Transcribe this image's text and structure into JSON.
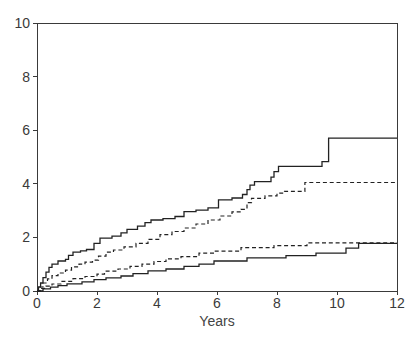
{
  "chart_data": {
    "type": "line",
    "subtype": "step-cumulative-incidence",
    "xlabel": "Years",
    "ylabel": "",
    "xlim": [
      0,
      12
    ],
    "ylim": [
      0,
      10
    ],
    "x_ticks": [
      0,
      2,
      4,
      6,
      8,
      10,
      12
    ],
    "y_ticks": [
      0,
      2,
      4,
      6,
      8,
      10
    ],
    "grid": false,
    "legend": "none",
    "box": true,
    "axis_color": "#3a3a3a",
    "line_color": "#222222",
    "background_color": "#ffffff",
    "series": [
      {
        "name": "upper-solid-curve",
        "style": "solid",
        "step": true,
        "final_value": 5.7,
        "points": [
          [
            0,
            0
          ],
          [
            0.05,
            0.15
          ],
          [
            0.12,
            0.3
          ],
          [
            0.2,
            0.5
          ],
          [
            0.3,
            0.7
          ],
          [
            0.4,
            0.88
          ],
          [
            0.5,
            1.0
          ],
          [
            0.7,
            1.12
          ],
          [
            0.95,
            1.18
          ],
          [
            1.05,
            1.33
          ],
          [
            1.2,
            1.45
          ],
          [
            1.45,
            1.5
          ],
          [
            1.65,
            1.55
          ],
          [
            1.9,
            1.78
          ],
          [
            2.1,
            1.97
          ],
          [
            2.5,
            2.05
          ],
          [
            2.8,
            2.17
          ],
          [
            3.0,
            2.3
          ],
          [
            3.35,
            2.42
          ],
          [
            3.6,
            2.55
          ],
          [
            3.8,
            2.65
          ],
          [
            4.2,
            2.7
          ],
          [
            4.6,
            2.78
          ],
          [
            4.9,
            2.96
          ],
          [
            5.3,
            3.02
          ],
          [
            5.7,
            3.1
          ],
          [
            6.05,
            3.4
          ],
          [
            6.5,
            3.47
          ],
          [
            6.85,
            3.6
          ],
          [
            7.0,
            3.78
          ],
          [
            7.1,
            3.95
          ],
          [
            7.25,
            4.08
          ],
          [
            7.8,
            4.25
          ],
          [
            7.9,
            4.45
          ],
          [
            8.05,
            4.65
          ],
          [
            9.5,
            4.83
          ],
          [
            9.72,
            5.7
          ],
          [
            12,
            5.7
          ]
        ]
      },
      {
        "name": "upper-dashed-curve",
        "style": "dashed",
        "step": true,
        "final_value": 4.05,
        "points": [
          [
            0,
            0
          ],
          [
            0.1,
            0.15
          ],
          [
            0.2,
            0.3
          ],
          [
            0.35,
            0.45
          ],
          [
            0.5,
            0.57
          ],
          [
            0.7,
            0.67
          ],
          [
            0.95,
            0.78
          ],
          [
            1.15,
            0.9
          ],
          [
            1.4,
            1.0
          ],
          [
            1.6,
            1.08
          ],
          [
            1.85,
            1.15
          ],
          [
            2.05,
            1.3
          ],
          [
            2.3,
            1.45
          ],
          [
            2.55,
            1.53
          ],
          [
            2.9,
            1.65
          ],
          [
            3.3,
            1.78
          ],
          [
            3.7,
            1.93
          ],
          [
            4.1,
            2.1
          ],
          [
            4.5,
            2.22
          ],
          [
            4.9,
            2.35
          ],
          [
            5.3,
            2.5
          ],
          [
            5.7,
            2.65
          ],
          [
            6.1,
            2.8
          ],
          [
            6.5,
            2.95
          ],
          [
            6.8,
            3.05
          ],
          [
            7.0,
            3.3
          ],
          [
            7.15,
            3.46
          ],
          [
            7.6,
            3.55
          ],
          [
            8.0,
            3.65
          ],
          [
            8.25,
            3.72
          ],
          [
            8.93,
            4.05
          ],
          [
            12,
            4.05
          ]
        ]
      },
      {
        "name": "lower-dashed-curve",
        "style": "dashed",
        "step": true,
        "final_value": 1.8,
        "points": [
          [
            0,
            0
          ],
          [
            0.12,
            0.1
          ],
          [
            0.3,
            0.18
          ],
          [
            0.5,
            0.26
          ],
          [
            0.8,
            0.36
          ],
          [
            1.2,
            0.46
          ],
          [
            1.6,
            0.54
          ],
          [
            2.0,
            0.63
          ],
          [
            2.25,
            0.74
          ],
          [
            2.7,
            0.82
          ],
          [
            3.1,
            0.92
          ],
          [
            3.5,
            1.0
          ],
          [
            3.9,
            1.1
          ],
          [
            4.3,
            1.2
          ],
          [
            4.8,
            1.28
          ],
          [
            5.4,
            1.41
          ],
          [
            5.9,
            1.49
          ],
          [
            6.8,
            1.62
          ],
          [
            7.9,
            1.69
          ],
          [
            9.0,
            1.8
          ],
          [
            12,
            1.8
          ]
        ]
      },
      {
        "name": "lower-solid-curve",
        "style": "solid",
        "step": true,
        "final_value": 1.78,
        "points": [
          [
            0,
            0
          ],
          [
            0.2,
            0.08
          ],
          [
            0.45,
            0.14
          ],
          [
            0.7,
            0.2
          ],
          [
            1.0,
            0.27
          ],
          [
            1.5,
            0.34
          ],
          [
            1.9,
            0.42
          ],
          [
            2.3,
            0.49
          ],
          [
            2.8,
            0.56
          ],
          [
            3.2,
            0.65
          ],
          [
            3.7,
            0.75
          ],
          [
            4.3,
            0.82
          ],
          [
            4.9,
            0.92
          ],
          [
            5.4,
            1.0
          ],
          [
            5.9,
            1.12
          ],
          [
            7.0,
            1.24
          ],
          [
            8.3,
            1.32
          ],
          [
            9.3,
            1.41
          ],
          [
            10.3,
            1.6
          ],
          [
            10.72,
            1.78
          ],
          [
            12,
            1.78
          ]
        ]
      }
    ]
  }
}
